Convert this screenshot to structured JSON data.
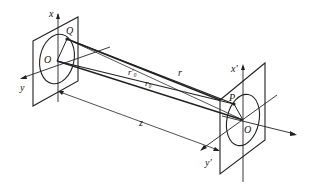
{
  "diagram": {
    "type": "diffraction-geometry",
    "source_plane": {
      "axis_x": "x",
      "axis_y": "y",
      "origin": "O",
      "point": "Q"
    },
    "observation_plane": {
      "axis_x": "x'",
      "axis_y": "y'",
      "origin": "O",
      "point": "P"
    },
    "distances": {
      "r": "r",
      "r0": "r₀",
      "r0_prime": "r'₀",
      "z": "z"
    }
  }
}
